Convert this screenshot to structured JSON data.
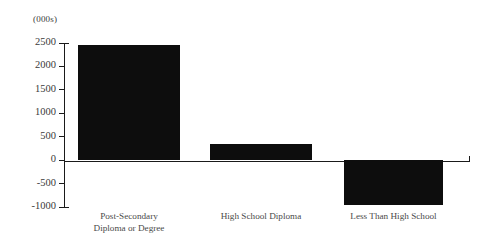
{
  "chart_data": {
    "type": "bar",
    "title": "",
    "subtitle": "",
    "xlabel": "",
    "ylabel": "",
    "unit_caption": "(000s)",
    "categories": [
      "Post-Secondary\nDiploma or Degree",
      "High School Diploma",
      "Less Than High School"
    ],
    "values": [
      2450,
      350,
      -950
    ],
    "ylim": [
      -1000,
      2500
    ],
    "yticks": [
      2500,
      2000,
      1500,
      1000,
      500,
      0,
      -500,
      -1000
    ],
    "ytick_labels": [
      "2500",
      "2000",
      "1500",
      "1000",
      "500",
      "0",
      "-500",
      "-1000"
    ],
    "grid": false,
    "legend": false,
    "legend_position": "none",
    "bar_color": "#0d0d0d",
    "axis_color": "#1a1a1a",
    "text_color": "#3a3a3a"
  }
}
